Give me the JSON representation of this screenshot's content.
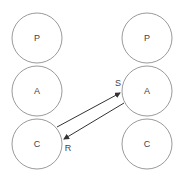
{
  "diagram": {
    "type": "transactional-analysis-ego-states",
    "left_person": {
      "states": [
        {
          "label": "P",
          "cx": 37,
          "cy": 38
        },
        {
          "label": "A",
          "cx": 37,
          "cy": 91
        },
        {
          "label": "C",
          "cx": 37,
          "cy": 144
        }
      ]
    },
    "right_person": {
      "states": [
        {
          "label": "P",
          "cx": 147,
          "cy": 38
        },
        {
          "label": "A",
          "cx": 147,
          "cy": 91
        },
        {
          "label": "C",
          "cx": 147,
          "cy": 144
        }
      ]
    },
    "radius": 25,
    "transactions": {
      "stimulus_label": "S",
      "response_label": "R"
    },
    "colors": {
      "circle_stroke": "#9a9a9a",
      "arrow": "#333333",
      "text": "#444444"
    }
  }
}
